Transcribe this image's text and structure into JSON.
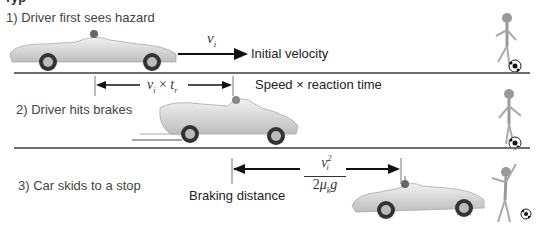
{
  "title_fragment": "Typ",
  "scenes": [
    {
      "label": "1) Driver first sees hazard",
      "velocity_symbol": "v",
      "velocity_subscript": "i",
      "arrow_caption": "Initial velocity"
    },
    {
      "label": "2) Driver hits brakes",
      "distance_formula": {
        "v": "v",
        "v_sub": "i",
        "times": "×",
        "t": "t",
        "t_sub": "r"
      },
      "caption": "Speed × reaction time"
    },
    {
      "label": "3) Car skids to a stop",
      "distance_formula": {
        "numerator_v": "v",
        "numerator_sub": "i",
        "numerator_sup": "2",
        "denominator_coef": "2",
        "mu": "μ",
        "mu_sub": "k",
        "g": "g"
      },
      "caption": "Braking distance"
    }
  ],
  "colors": {
    "ground": "#6e6e6e",
    "arrow": "#111111",
    "car_body": "#d6d6d6",
    "text": "#333333"
  }
}
